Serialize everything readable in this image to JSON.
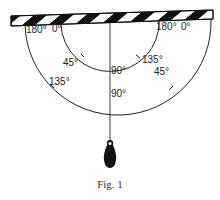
{
  "figure": {
    "caption": "Fig. 1"
  },
  "outer_scale": {
    "labels": {
      "left_end": "180°",
      "left_zero": "0°",
      "left_diagonal": "135°",
      "bottom": "90°",
      "right_diagonal": "45°",
      "right_end": "180°",
      "right_zero": "0°"
    }
  },
  "inner_scale": {
    "labels": {
      "left_diagonal": "45°",
      "bottom": "90°",
      "right_diagonal": "135°"
    }
  },
  "colors": {
    "ink": "#222222",
    "background": "#ffffff"
  }
}
